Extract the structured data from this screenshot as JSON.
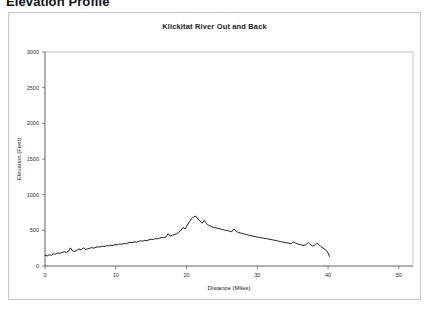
{
  "page": {
    "heading": "Elevation Profile"
  },
  "chart_data": {
    "type": "line",
    "title": "Klickitat River Out and Back",
    "xlabel": "Distance (Miles)",
    "ylabel": "Elevation (Feet)",
    "xlim": [
      0,
      52
    ],
    "ylim": [
      0,
      3000
    ],
    "xticks": [
      0,
      10,
      20,
      30,
      40,
      50
    ],
    "yticks": [
      0,
      500,
      1000,
      1500,
      2000,
      2500,
      3000
    ],
    "grid": "horizontal",
    "legend": "none",
    "series_color": "#1f1f1f",
    "series": [
      {
        "name": "Elevation",
        "x": [
          0.0,
          0.3,
          0.6,
          0.9,
          1.2,
          1.5,
          1.8,
          2.1,
          2.4,
          2.7,
          3.0,
          3.3,
          3.6,
          3.9,
          4.2,
          4.5,
          4.8,
          5.1,
          5.4,
          5.7,
          6.0,
          6.3,
          6.6,
          6.9,
          7.2,
          7.5,
          7.8,
          8.1,
          8.4,
          8.7,
          9.0,
          9.3,
          9.6,
          9.9,
          10.2,
          10.5,
          10.8,
          11.1,
          11.4,
          11.7,
          12.0,
          12.3,
          12.6,
          12.9,
          13.2,
          13.5,
          13.8,
          14.1,
          14.4,
          14.7,
          15.0,
          15.3,
          15.6,
          15.9,
          16.2,
          16.5,
          16.8,
          17.1,
          17.4,
          17.7,
          18.0,
          18.3,
          18.6,
          18.9,
          19.2,
          19.5,
          19.8,
          20.1,
          20.4,
          20.7,
          21.0,
          21.3,
          21.6,
          21.9,
          22.2,
          22.5,
          22.8,
          23.1,
          23.4,
          23.7,
          24.0,
          24.3,
          24.6,
          24.9,
          25.2,
          25.5,
          25.8,
          26.1,
          26.4,
          26.7,
          27.0,
          27.3,
          27.6,
          27.9,
          28.2,
          28.5,
          28.8,
          29.1,
          29.4,
          29.7,
          30.0,
          30.3,
          30.6,
          30.9,
          31.2,
          31.5,
          31.8,
          32.1,
          32.4,
          32.7,
          33.0,
          33.3,
          33.6,
          33.9,
          34.2,
          34.5,
          34.8,
          35.1,
          35.4,
          35.7,
          36.0,
          36.3,
          36.6,
          36.9,
          37.2,
          37.5,
          37.8,
          38.1,
          38.4,
          38.7,
          39.0,
          39.3,
          39.6,
          39.9,
          40.2
        ],
        "y": [
          150,
          140,
          158,
          150,
          172,
          165,
          182,
          175,
          190,
          198,
          192,
          205,
          255,
          210,
          205,
          218,
          240,
          225,
          255,
          232,
          240,
          248,
          258,
          250,
          262,
          270,
          265,
          278,
          272,
          285,
          280,
          292,
          288,
          300,
          296,
          308,
          305,
          316,
          312,
          322,
          330,
          325,
          338,
          333,
          345,
          352,
          348,
          360,
          356,
          368,
          375,
          372,
          385,
          380,
          392,
          400,
          396,
          408,
          455,
          420,
          432,
          440,
          452,
          470,
          500,
          540,
          520,
          570,
          620,
          660,
          690,
          700,
          660,
          630,
          600,
          640,
          600,
          570,
          560,
          545,
          540,
          530,
          525,
          515,
          510,
          500,
          495,
          488,
          480,
          520,
          490,
          470,
          465,
          455,
          448,
          440,
          432,
          425,
          418,
          412,
          405,
          400,
          395,
          390,
          385,
          380,
          372,
          368,
          362,
          355,
          348,
          342,
          336,
          330,
          325,
          318,
          312,
          340,
          320,
          310,
          300,
          295,
          288,
          300,
          330,
          300,
          280,
          290,
          320,
          300,
          270,
          250,
          230,
          200,
          135
        ]
      }
    ]
  }
}
